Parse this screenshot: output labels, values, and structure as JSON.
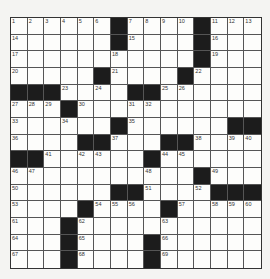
{
  "puzzle": {
    "rows": 15,
    "cols": 15,
    "colors": {
      "black": "#1c1c1c",
      "white": "#fdfdfb",
      "line": "#555555"
    },
    "black_cells": [
      [
        0,
        6
      ],
      [
        0,
        11
      ],
      [
        1,
        6
      ],
      [
        1,
        11
      ],
      [
        2,
        11
      ],
      [
        3,
        5
      ],
      [
        3,
        10
      ],
      [
        4,
        0
      ],
      [
        4,
        1
      ],
      [
        4,
        2
      ],
      [
        4,
        7
      ],
      [
        4,
        8
      ],
      [
        5,
        3
      ],
      [
        6,
        6
      ],
      [
        6,
        13
      ],
      [
        6,
        14
      ],
      [
        7,
        4
      ],
      [
        7,
        5
      ],
      [
        7,
        9
      ],
      [
        7,
        10
      ],
      [
        8,
        0
      ],
      [
        8,
        1
      ],
      [
        8,
        8
      ],
      [
        9,
        11
      ],
      [
        10,
        6
      ],
      [
        10,
        7
      ],
      [
        10,
        12
      ],
      [
        10,
        13
      ],
      [
        10,
        14
      ],
      [
        11,
        4
      ],
      [
        11,
        9
      ],
      [
        12,
        3
      ],
      [
        13,
        3
      ],
      [
        13,
        8
      ],
      [
        14,
        3
      ],
      [
        14,
        8
      ]
    ],
    "numbers": [
      [
        0,
        0,
        "1"
      ],
      [
        0,
        1,
        "2"
      ],
      [
        0,
        2,
        "3"
      ],
      [
        0,
        3,
        "4"
      ],
      [
        0,
        4,
        "5"
      ],
      [
        0,
        5,
        "6"
      ],
      [
        0,
        7,
        "7"
      ],
      [
        0,
        8,
        "8"
      ],
      [
        0,
        9,
        "9"
      ],
      [
        0,
        10,
        "10"
      ],
      [
        0,
        12,
        "11"
      ],
      [
        0,
        13,
        "12"
      ],
      [
        0,
        14,
        "13"
      ],
      [
        1,
        0,
        "14"
      ],
      [
        1,
        7,
        "15"
      ],
      [
        1,
        12,
        "16"
      ],
      [
        2,
        0,
        "17"
      ],
      [
        2,
        6,
        "18"
      ],
      [
        2,
        12,
        "19"
      ],
      [
        3,
        0,
        "20"
      ],
      [
        3,
        6,
        "21"
      ],
      [
        3,
        11,
        "22"
      ],
      [
        4,
        3,
        "23"
      ],
      [
        4,
        5,
        "24"
      ],
      [
        4,
        9,
        "25"
      ],
      [
        4,
        10,
        "26"
      ],
      [
        5,
        0,
        "27"
      ],
      [
        5,
        1,
        "28"
      ],
      [
        5,
        2,
        "29"
      ],
      [
        5,
        4,
        "30"
      ],
      [
        5,
        7,
        "31"
      ],
      [
        5,
        8,
        "32"
      ],
      [
        6,
        0,
        "33"
      ],
      [
        6,
        3,
        "34"
      ],
      [
        6,
        7,
        "35"
      ],
      [
        7,
        0,
        "36"
      ],
      [
        7,
        6,
        "37"
      ],
      [
        7,
        11,
        "38"
      ],
      [
        7,
        13,
        "39"
      ],
      [
        7,
        14,
        "40"
      ],
      [
        8,
        2,
        "41"
      ],
      [
        8,
        4,
        "42"
      ],
      [
        8,
        5,
        "43"
      ],
      [
        8,
        9,
        "44"
      ],
      [
        8,
        10,
        "45"
      ],
      [
        9,
        0,
        "46"
      ],
      [
        9,
        1,
        "47"
      ],
      [
        9,
        8,
        "48"
      ],
      [
        9,
        12,
        "49"
      ],
      [
        10,
        0,
        "50"
      ],
      [
        10,
        8,
        "51"
      ],
      [
        10,
        11,
        "52"
      ],
      [
        11,
        0,
        "53"
      ],
      [
        11,
        5,
        "54"
      ],
      [
        11,
        6,
        "55"
      ],
      [
        11,
        7,
        "56"
      ],
      [
        11,
        10,
        "57"
      ],
      [
        11,
        12,
        "58"
      ],
      [
        11,
        13,
        "59"
      ],
      [
        11,
        14,
        "60"
      ],
      [
        12,
        0,
        "61"
      ],
      [
        12,
        4,
        "62"
      ],
      [
        12,
        9,
        "63"
      ],
      [
        13,
        0,
        "64"
      ],
      [
        13,
        4,
        "65"
      ],
      [
        13,
        9,
        "66"
      ],
      [
        14,
        0,
        "67"
      ],
      [
        14,
        4,
        "68"
      ],
      [
        14,
        9,
        "69"
      ]
    ]
  }
}
